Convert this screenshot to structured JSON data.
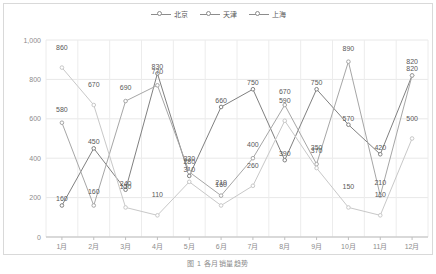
{
  "caption": "图 1  各月销量趋势",
  "legend": {
    "position": "top-center",
    "items": [
      {
        "label": "北京",
        "color": "#808080",
        "icon": "circle-marker-icon"
      },
      {
        "label": "天津",
        "color": "#a6a6a6",
        "icon": "circle-marker-icon"
      },
      {
        "label": "上海",
        "color": "#c8c8c8",
        "icon": "circle-marker-icon"
      }
    ]
  },
  "chart_data": {
    "type": "line",
    "title": "",
    "xlabel": "",
    "ylabel": "",
    "ylim": [
      0,
      1000
    ],
    "yticks": [
      0,
      200,
      400,
      600,
      800,
      1000
    ],
    "ytick_labels": [
      "0",
      "200",
      "400",
      "600",
      "800",
      "1,000"
    ],
    "grid": true,
    "legend_position": "top-center",
    "categories": [
      "1月",
      "2月",
      "3月",
      "4月",
      "5月",
      "6月",
      "7月",
      "8月",
      "9月",
      "10月",
      "11月",
      "12月"
    ],
    "series": [
      {
        "name": "北京",
        "color": "#808080",
        "values": [
          160,
          450,
          240,
          830,
          310,
          660,
          750,
          390,
          750,
          570,
          420,
          820
        ]
      },
      {
        "name": "天津",
        "color": "#a6a6a6",
        "values": [
          580,
          160,
          690,
          770,
          330,
          210,
          400,
          670,
          370,
          890,
          210,
          820
        ]
      },
      {
        "name": "上海",
        "color": "#c8c8c8",
        "values": [
          860,
          670,
          150,
          110,
          280,
          160,
          260,
          590,
          350,
          150,
          110,
          500
        ]
      }
    ]
  }
}
